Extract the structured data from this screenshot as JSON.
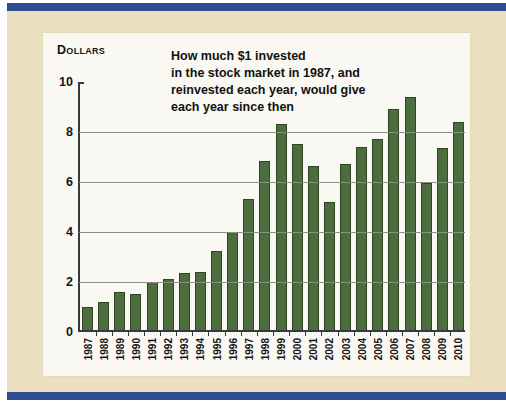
{
  "chart": {
    "unit_label": "Dollars",
    "title": "How much $1 invested\nin the stock market in 1987, and\nreinvested each year, would give\neach year since then"
  },
  "colors": {
    "border_navy": "#2e4d8f",
    "card_cream": "#eae0bf",
    "panel_white": "#faf8f2",
    "bar_green": "#4c6e3e",
    "bar_outline": "#2c4722",
    "gridline_gray": "#8d8d85",
    "axis_dark": "#3a3a3a",
    "text_black": "#151515"
  },
  "chart_data": {
    "type": "bar",
    "title": "How much $1 invested in the stock market in 1987, and reinvested each year, would give each year since then",
    "ylabel": "Dollars",
    "xlabel": "",
    "categories": [
      "1987",
      "1988",
      "1989",
      "1990",
      "1991",
      "1992",
      "1993",
      "1994",
      "1995",
      "1996",
      "1997",
      "1998",
      "1999",
      "2000",
      "2001",
      "2002",
      "2003",
      "2004",
      "2005",
      "2006",
      "2007",
      "2008",
      "2009",
      "2010"
    ],
    "values": [
      1.0,
      1.2,
      1.6,
      1.5,
      2.0,
      2.1,
      2.35,
      2.4,
      3.25,
      4.0,
      5.3,
      6.85,
      8.3,
      7.5,
      6.65,
      5.2,
      6.7,
      7.4,
      7.7,
      8.9,
      9.4,
      5.95,
      7.35,
      8.4
    ],
    "ylim": [
      0,
      10
    ],
    "yticks": [
      0,
      2,
      4,
      6,
      8,
      10
    ],
    "grid": true,
    "legend": false,
    "bar_color": "#4c6e3e"
  }
}
